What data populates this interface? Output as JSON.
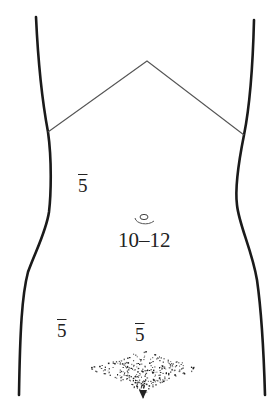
{
  "diagram": {
    "colors": {
      "outline": "#1a1a1a",
      "costal_margin": "#555555",
      "text": "#222222",
      "background": "#ffffff"
    },
    "ports": [
      {
        "id": "left-upper",
        "label": "5",
        "overline": true,
        "x": 78,
        "y": 178
      },
      {
        "id": "umbilical",
        "label": "10–12",
        "overline": false,
        "x": 118,
        "y": 230
      },
      {
        "id": "left-lower",
        "label": "5",
        "overline": true,
        "x": 57,
        "y": 322
      },
      {
        "id": "suprapubic",
        "label": "5",
        "overline": true,
        "x": 135,
        "y": 326
      }
    ]
  }
}
